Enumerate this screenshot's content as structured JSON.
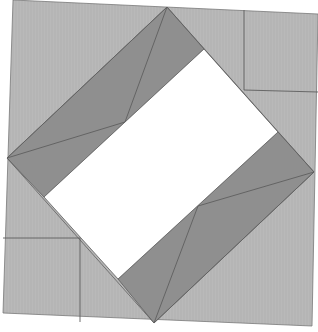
{
  "diagram": {
    "title": "Square-in-a-square quilt block",
    "colors": {
      "background": "#ffffff",
      "light_fabric": "#b9b9b9",
      "dark_fabric": "#8f8f8f",
      "center": "#ffffff",
      "seam": "#5f5f5f",
      "outline": "#7a7a7a"
    },
    "outer_block": [
      [
        13,
        0
      ],
      [
        318,
        14
      ],
      [
        312,
        326
      ],
      [
        3,
        313
      ]
    ],
    "diamond": [
      [
        167,
        7
      ],
      [
        314,
        172
      ],
      [
        154,
        323
      ],
      [
        7,
        158
      ]
    ],
    "center_rect": [
      [
        204,
        49
      ],
      [
        278,
        132
      ],
      [
        118,
        279
      ],
      [
        44,
        197
      ]
    ],
    "dark_band_upper_left": [
      [
        167,
        7
      ],
      [
        204,
        49
      ],
      [
        44,
        197
      ],
      [
        7,
        158
      ]
    ],
    "dark_band_lower_right": [
      [
        278,
        132
      ],
      [
        314,
        172
      ],
      [
        154,
        323
      ],
      [
        118,
        279
      ]
    ],
    "seams": [
      [
        [
          167,
          7
        ],
        [
          125,
          122
        ]
      ],
      [
        [
          7,
          158
        ],
        [
          125,
          122
        ]
      ],
      [
        [
          314,
          172
        ],
        [
          198,
          206
        ]
      ],
      [
        [
          154,
          323
        ],
        [
          198,
          206
        ]
      ],
      [
        [
          244,
          10
        ],
        [
          244,
          90
        ]
      ],
      [
        [
          244,
          90
        ],
        [
          318,
          92
        ]
      ],
      [
        [
          3,
          238
        ],
        [
          80,
          238
        ]
      ],
      [
        [
          80,
          238
        ],
        [
          80,
          322
        ]
      ]
    ]
  }
}
